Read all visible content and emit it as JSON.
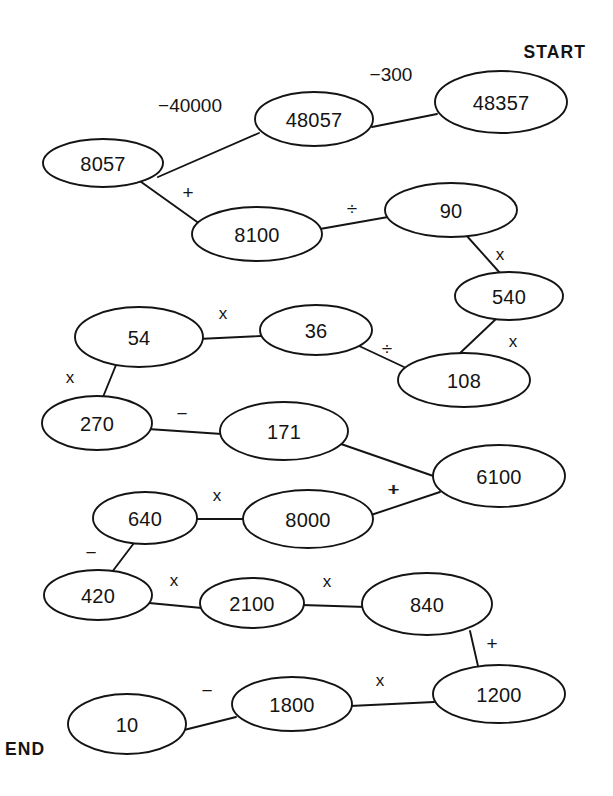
{
  "diagram": {
    "type": "number-chain-puzzle",
    "title": "",
    "markers": {
      "start_label": "START",
      "end_label": "END"
    },
    "colors": {
      "background": "#ffffff",
      "stroke": "#141414",
      "text": "#141414"
    },
    "nodes": [
      {
        "id": "n1",
        "value": "48357",
        "cx": 501,
        "cy": 102,
        "rx": 66,
        "ry": 31
      },
      {
        "id": "n2",
        "value": "48057",
        "cx": 314,
        "cy": 119,
        "rx": 59,
        "ry": 27
      },
      {
        "id": "n3",
        "value": "8057",
        "cx": 103,
        "cy": 163,
        "rx": 60,
        "ry": 24
      },
      {
        "id": "n4",
        "value": "8100",
        "cx": 257,
        "cy": 234,
        "rx": 65,
        "ry": 27
      },
      {
        "id": "n5",
        "value": "90",
        "cx": 451,
        "cy": 210,
        "rx": 66,
        "ry": 27
      },
      {
        "id": "n6",
        "value": "540",
        "cx": 509,
        "cy": 296,
        "rx": 54,
        "ry": 24
      },
      {
        "id": "n7",
        "value": "108",
        "cx": 464,
        "cy": 380,
        "rx": 66,
        "ry": 27
      },
      {
        "id": "n8",
        "value": "36",
        "cx": 316,
        "cy": 330,
        "rx": 56,
        "ry": 25
      },
      {
        "id": "n9",
        "value": "54",
        "cx": 139,
        "cy": 337,
        "rx": 64,
        "ry": 30
      },
      {
        "id": "n10",
        "value": "270",
        "cx": 97,
        "cy": 423,
        "rx": 55,
        "ry": 27
      },
      {
        "id": "n11",
        "value": "171",
        "cx": 284,
        "cy": 431,
        "rx": 64,
        "ry": 29
      },
      {
        "id": "n12",
        "value": "6100",
        "cx": 499,
        "cy": 476,
        "rx": 66,
        "ry": 31
      },
      {
        "id": "n13",
        "value": "8000",
        "cx": 308,
        "cy": 519,
        "rx": 65,
        "ry": 29
      },
      {
        "id": "n14",
        "value": "640",
        "cx": 145,
        "cy": 518,
        "rx": 52,
        "ry": 26
      },
      {
        "id": "n15",
        "value": "420",
        "cx": 98,
        "cy": 595,
        "rx": 54,
        "ry": 25
      },
      {
        "id": "n16",
        "value": "2100",
        "cx": 252,
        "cy": 603,
        "rx": 52,
        "ry": 25
      },
      {
        "id": "n17",
        "value": "840",
        "cx": 427,
        "cy": 604,
        "rx": 65,
        "ry": 31
      },
      {
        "id": "n18",
        "value": "1200",
        "cx": 499,
        "cy": 694,
        "rx": 66,
        "ry": 29
      },
      {
        "id": "n19",
        "value": "1800",
        "cx": 292,
        "cy": 704,
        "rx": 60,
        "ry": 27
      },
      {
        "id": "n20",
        "value": "10",
        "cx": 127,
        "cy": 724,
        "rx": 59,
        "ry": 30
      }
    ],
    "edges": [
      {
        "from": "n1",
        "to": "n2",
        "operator": "−300",
        "x1": 437,
        "y1": 114,
        "x2": 372,
        "y2": 127,
        "lx": 391,
        "ly": 74,
        "size": "normal"
      },
      {
        "from": "n2",
        "to": "n3",
        "operator": "−40000",
        "x1": 259,
        "y1": 133,
        "x2": 158,
        "y2": 177,
        "lx": 190,
        "ly": 105,
        "size": "normal"
      },
      {
        "from": "n3",
        "to": "n4",
        "operator": "+",
        "x1": 137,
        "y1": 179,
        "x2": 200,
        "y2": 224,
        "lx": 188,
        "ly": 192,
        "size": "normal"
      },
      {
        "from": "n4",
        "to": "n5",
        "operator": "÷",
        "x1": 320,
        "y1": 229,
        "x2": 388,
        "y2": 217,
        "lx": 352,
        "ly": 208,
        "size": "normal"
      },
      {
        "from": "n5",
        "to": "n6",
        "operator": "x",
        "x1": 466,
        "y1": 235,
        "x2": 500,
        "y2": 273,
        "lx": 500,
        "ly": 254,
        "size": "small"
      },
      {
        "from": "n6",
        "to": "n7",
        "operator": "x",
        "x1": 497,
        "y1": 318,
        "x2": 458,
        "y2": 355,
        "lx": 513,
        "ly": 341,
        "size": "small"
      },
      {
        "from": "n7",
        "to": "n8",
        "operator": "÷",
        "x1": 404,
        "y1": 367,
        "x2": 357,
        "y2": 345,
        "lx": 387,
        "ly": 348,
        "size": "normal"
      },
      {
        "from": "n8",
        "to": "n9",
        "operator": "x",
        "x1": 261,
        "y1": 336,
        "x2": 198,
        "y2": 339,
        "lx": 223,
        "ly": 313,
        "size": "small"
      },
      {
        "from": "n9",
        "to": "n10",
        "operator": "x",
        "x1": 116,
        "y1": 365,
        "x2": 103,
        "y2": 397,
        "lx": 70,
        "ly": 377,
        "size": "small"
      },
      {
        "from": "n10",
        "to": "n11",
        "operator": "−",
        "x1": 148,
        "y1": 429,
        "x2": 222,
        "y2": 434,
        "lx": 182,
        "ly": 413,
        "size": "normal"
      },
      {
        "from": "n11",
        "to": "n12",
        "operator": "+",
        "x1": 341,
        "y1": 444,
        "x2": 442,
        "y2": 479,
        "lx": 394,
        "ly": 489,
        "size": "normal"
      },
      {
        "from": "n12",
        "to": "n13",
        "operator": "+",
        "x1": 440,
        "y1": 492,
        "x2": 371,
        "y2": 515,
        "lx": 393,
        "ly": 489,
        "size": "normal"
      },
      {
        "from": "n13",
        "to": "n14",
        "operator": "x",
        "x1": 243,
        "y1": 519,
        "x2": 196,
        "y2": 519,
        "lx": 217,
        "ly": 495,
        "size": "small"
      },
      {
        "from": "n14",
        "to": "n15",
        "operator": "−",
        "x1": 134,
        "y1": 543,
        "x2": 112,
        "y2": 572,
        "lx": 91,
        "ly": 552,
        "size": "normal"
      },
      {
        "from": "n15",
        "to": "n16",
        "operator": "x",
        "x1": 149,
        "y1": 603,
        "x2": 202,
        "y2": 608,
        "lx": 174,
        "ly": 580,
        "size": "small"
      },
      {
        "from": "n16",
        "to": "n17",
        "operator": "x",
        "x1": 302,
        "y1": 605,
        "x2": 366,
        "y2": 607,
        "lx": 327,
        "ly": 581,
        "size": "small"
      },
      {
        "from": "n17",
        "to": "n18",
        "operator": "+",
        "x1": 470,
        "y1": 631,
        "x2": 478,
        "y2": 666,
        "lx": 492,
        "ly": 643,
        "size": "normal"
      },
      {
        "from": "n18",
        "to": "n19",
        "operator": "x",
        "x1": 434,
        "y1": 702,
        "x2": 350,
        "y2": 706,
        "lx": 380,
        "ly": 680,
        "size": "small"
      },
      {
        "from": "n19",
        "to": "n20",
        "operator": "−",
        "x1": 236,
        "y1": 717,
        "x2": 184,
        "y2": 730,
        "lx": 207,
        "ly": 690,
        "size": "normal"
      }
    ],
    "marker_positions": {
      "start": {
        "x": 586,
        "y": 58
      },
      "end": {
        "x": 5,
        "y": 755
      }
    }
  }
}
